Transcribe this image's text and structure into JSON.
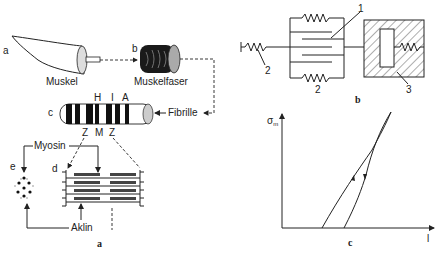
{
  "panel_a": {
    "caption": "a",
    "sub_labels": {
      "a": "a",
      "b": "b",
      "c": "c",
      "d": "d",
      "e": "e"
    },
    "muscle_label": "Muskel",
    "fiber_label": "Muskelfaser",
    "fibril_label": "Fibrille",
    "band_labels": {
      "H": "H",
      "I": "I",
      "A": "A"
    },
    "line_labels": {
      "Z1": "Z",
      "M": "M",
      "Z2": "Z"
    },
    "myosin_label": "Myosin",
    "actin_label": "Aklin"
  },
  "panel_b": {
    "caption": "b",
    "part_labels": {
      "one": "1",
      "two_left": "2",
      "two_bottom": "2",
      "three": "3"
    }
  },
  "panel_c": {
    "caption": "c",
    "y_label": "σ",
    "y_label_sub": "m",
    "x_label": "l"
  }
}
